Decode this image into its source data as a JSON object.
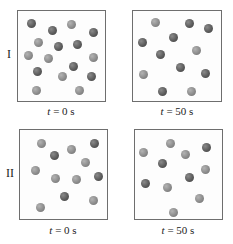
{
  "rows": [
    {
      "label": "I",
      "panels": [
        {
          "time_var": "t",
          "time_rest": " = 0 s",
          "box": {
            "x": 17,
            "y": 10,
            "w": 89,
            "h": 92
          },
          "balls": [
            {
              "x": 31,
              "y": 23,
              "shade": "dark"
            },
            {
              "x": 52,
              "y": 30,
              "shade": "dark"
            },
            {
              "x": 71,
              "y": 24,
              "shade": "light"
            },
            {
              "x": 93,
              "y": 32,
              "shade": "dark"
            },
            {
              "x": 38,
              "y": 42,
              "shade": "light"
            },
            {
              "x": 58,
              "y": 46,
              "shade": "dark"
            },
            {
              "x": 77,
              "y": 44,
              "shade": "dark"
            },
            {
              "x": 28,
              "y": 55,
              "shade": "light"
            },
            {
              "x": 48,
              "y": 58,
              "shade": "light"
            },
            {
              "x": 93,
              "y": 57,
              "shade": "light"
            },
            {
              "x": 73,
              "y": 66,
              "shade": "dark"
            },
            {
              "x": 37,
              "y": 71,
              "shade": "dark"
            },
            {
              "x": 62,
              "y": 76,
              "shade": "light"
            },
            {
              "x": 91,
              "y": 76,
              "shade": "dark"
            },
            {
              "x": 36,
              "y": 90,
              "shade": "light"
            },
            {
              "x": 79,
              "y": 90,
              "shade": "light"
            }
          ]
        },
        {
          "time_var": "t",
          "time_rest": " = 50 s",
          "box": {
            "x": 132,
            "y": 10,
            "w": 90,
            "h": 92
          },
          "balls": [
            {
              "x": 155,
              "y": 22,
              "shade": "light"
            },
            {
              "x": 189,
              "y": 23,
              "shade": "dark"
            },
            {
              "x": 208,
              "y": 28,
              "shade": "dark"
            },
            {
              "x": 142,
              "y": 42,
              "shade": "dark"
            },
            {
              "x": 173,
              "y": 37,
              "shade": "dark"
            },
            {
              "x": 160,
              "y": 54,
              "shade": "dark"
            },
            {
              "x": 196,
              "y": 50,
              "shade": "light"
            },
            {
              "x": 180,
              "y": 67,
              "shade": "dark"
            },
            {
              "x": 143,
              "y": 74,
              "shade": "light"
            },
            {
              "x": 205,
              "y": 73,
              "shade": "dark"
            },
            {
              "x": 162,
              "y": 91,
              "shade": "dark"
            },
            {
              "x": 191,
              "y": 91,
              "shade": "light"
            }
          ]
        }
      ]
    },
    {
      "label": "II",
      "panels": [
        {
          "time_var": "t",
          "time_rest": " = 0 s",
          "box": {
            "x": 19,
            "y": 129,
            "w": 89,
            "h": 91
          },
          "balls": [
            {
              "x": 41,
              "y": 143,
              "shade": "light"
            },
            {
              "x": 54,
              "y": 155,
              "shade": "dark"
            },
            {
              "x": 71,
              "y": 149,
              "shade": "light"
            },
            {
              "x": 94,
              "y": 143,
              "shade": "dark"
            },
            {
              "x": 85,
              "y": 162,
              "shade": "light"
            },
            {
              "x": 35,
              "y": 170,
              "shade": "light"
            },
            {
              "x": 55,
              "y": 178,
              "shade": "light"
            },
            {
              "x": 76,
              "y": 179,
              "shade": "light"
            },
            {
              "x": 98,
              "y": 176,
              "shade": "dark"
            },
            {
              "x": 64,
              "y": 196,
              "shade": "dark"
            },
            {
              "x": 93,
              "y": 200,
              "shade": "light"
            },
            {
              "x": 40,
              "y": 207,
              "shade": "light"
            }
          ]
        },
        {
          "time_var": "t",
          "time_rest": " = 50 s",
          "box": {
            "x": 134,
            "y": 129,
            "w": 89,
            "h": 91
          },
          "balls": [
            {
              "x": 143,
              "y": 152,
              "shade": "light"
            },
            {
              "x": 170,
              "y": 143,
              "shade": "light"
            },
            {
              "x": 206,
              "y": 147,
              "shade": "dark"
            },
            {
              "x": 185,
              "y": 154,
              "shade": "light"
            },
            {
              "x": 162,
              "y": 163,
              "shade": "dark"
            },
            {
              "x": 205,
              "y": 169,
              "shade": "light"
            },
            {
              "x": 189,
              "y": 177,
              "shade": "dark"
            },
            {
              "x": 145,
              "y": 183,
              "shade": "dark"
            },
            {
              "x": 167,
              "y": 187,
              "shade": "light"
            },
            {
              "x": 199,
              "y": 198,
              "shade": "light"
            },
            {
              "x": 173,
              "y": 212,
              "shade": "light"
            }
          ]
        }
      ]
    }
  ],
  "colors": {
    "ball_light": "#8c8c8c",
    "ball_dark": "#5c5c5c",
    "box_border": "#6e6e6e"
  }
}
